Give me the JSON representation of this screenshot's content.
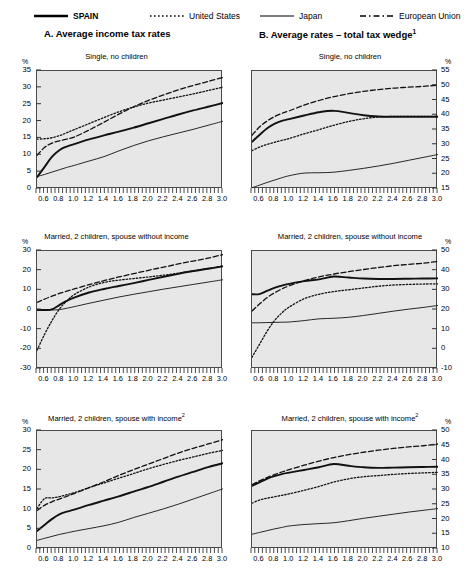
{
  "legend": {
    "items": [
      {
        "label": "SPAIN",
        "style": "bold-solid",
        "bold": true
      },
      {
        "label": "United States",
        "style": "dotted",
        "bold": false
      },
      {
        "label": "Japan",
        "style": "solid",
        "bold": false
      },
      {
        "label": "European Union",
        "style": "dashed",
        "bold": false
      }
    ]
  },
  "panels": [
    {
      "label": "A.  Average income tax rates",
      "footnote": ""
    },
    {
      "label": "B.  Average rates – total tax wedge",
      "footnote": "1"
    }
  ],
  "axis": {
    "percent_symbol": "%",
    "x_ticks": [
      "0.6",
      "0.8",
      "1.0",
      "1.2",
      "1.4",
      "1.6",
      "1.8",
      "2.0",
      "2.2",
      "2.4",
      "2.6",
      "2.8",
      "3.0"
    ]
  },
  "chart_data": [
    {
      "id": "A1",
      "type": "line",
      "title": "Single, no children",
      "panel": "A. Average income tax rates",
      "xlabel": "",
      "ylabel": "%",
      "xlim": [
        0.5,
        3.0
      ],
      "ylim": [
        0,
        35
      ],
      "yticks": [
        0,
        5,
        10,
        15,
        20,
        25,
        30,
        35
      ],
      "x": [
        0.5,
        0.6,
        0.7,
        0.8,
        0.9,
        1.0,
        1.2,
        1.4,
        1.6,
        1.8,
        2.0,
        2.2,
        2.4,
        2.6,
        2.8,
        3.0
      ],
      "series": [
        {
          "name": "SPAIN",
          "style": "bold-solid",
          "values": [
            3.5,
            6.5,
            9.5,
            11.5,
            12.6,
            13.3,
            14.7,
            15.9,
            17.0,
            18.2,
            19.5,
            20.8,
            22.1,
            23.3,
            24.4,
            25.5
          ]
        },
        {
          "name": "United States",
          "style": "dotted",
          "values": [
            14.8,
            14.9,
            15.2,
            15.8,
            16.7,
            17.6,
            19.4,
            21.2,
            22.9,
            24.3,
            25.5,
            26.4,
            27.3,
            28.2,
            29.2,
            30.2
          ]
        },
        {
          "name": "Japan",
          "style": "solid",
          "values": [
            3.7,
            4.3,
            5.0,
            5.7,
            6.4,
            7.0,
            8.3,
            9.6,
            11.3,
            12.9,
            14.3,
            15.5,
            16.6,
            17.7,
            18.9,
            20.1
          ]
        },
        {
          "name": "European Union",
          "style": "dashed",
          "values": [
            10.0,
            12.3,
            13.6,
            14.3,
            14.8,
            15.4,
            17.5,
            19.8,
            22.2,
            24.4,
            26.3,
            27.9,
            29.4,
            30.7,
            31.9,
            33.1
          ]
        }
      ]
    },
    {
      "id": "B1",
      "type": "line",
      "title": "Single, no children",
      "panel": "B. Average rates – total tax wedge",
      "xlabel": "",
      "ylabel": "%",
      "xlim": [
        0.5,
        3.0
      ],
      "ylim": [
        15,
        55
      ],
      "yticks": [
        15,
        20,
        25,
        30,
        35,
        40,
        45,
        50,
        55
      ],
      "x": [
        0.5,
        0.6,
        0.7,
        0.8,
        0.9,
        1.0,
        1.2,
        1.4,
        1.6,
        1.8,
        2.0,
        2.2,
        2.4,
        2.6,
        2.8,
        3.0
      ],
      "series": [
        {
          "name": "SPAIN",
          "style": "bold-solid",
          "values": [
            31.0,
            33.3,
            35.5,
            37.1,
            38.1,
            38.7,
            39.9,
            41.0,
            41.5,
            40.8,
            40.0,
            39.6,
            39.5,
            39.5,
            39.5,
            39.5
          ]
        },
        {
          "name": "United States",
          "style": "dotted",
          "values": [
            28.0,
            29.2,
            30.1,
            30.8,
            31.5,
            32.1,
            33.7,
            35.1,
            36.6,
            37.9,
            38.8,
            39.4,
            39.6,
            39.6,
            39.6,
            39.6
          ]
        },
        {
          "name": "Japan",
          "style": "solid",
          "values": [
            15.4,
            16.3,
            17.2,
            18.0,
            18.8,
            19.5,
            20.4,
            20.5,
            20.7,
            21.3,
            22.0,
            22.8,
            23.7,
            24.7,
            25.7,
            26.7
          ]
        },
        {
          "name": "European Union",
          "style": "dashed",
          "values": [
            33.2,
            36.0,
            38.0,
            39.5,
            40.6,
            41.5,
            43.4,
            45.0,
            46.3,
            47.3,
            48.1,
            48.7,
            49.2,
            49.5,
            49.8,
            50.2
          ]
        }
      ]
    },
    {
      "id": "A2",
      "type": "line",
      "title": "Married, 2 children, spouse without income",
      "panel": "A. Average income tax rates",
      "xlabel": "",
      "ylabel": "%",
      "xlim": [
        0.5,
        3.0
      ],
      "ylim": [
        -30,
        30
      ],
      "yticks": [
        -30,
        -20,
        -10,
        0,
        10,
        20,
        30
      ],
      "x": [
        0.5,
        0.6,
        0.7,
        0.8,
        0.9,
        1.0,
        1.2,
        1.4,
        1.6,
        1.8,
        2.0,
        2.2,
        2.4,
        2.6,
        2.8,
        3.0
      ],
      "series": [
        {
          "name": "SPAIN",
          "style": "bold-solid",
          "values": [
            0.0,
            0.0,
            0.3,
            2.5,
            4.6,
            6.3,
            8.9,
            10.7,
            12.2,
            13.7,
            15.3,
            16.9,
            18.4,
            19.8,
            21.0,
            22.2
          ]
        },
        {
          "name": "United States",
          "style": "dotted",
          "values": [
            -20.5,
            -12.5,
            -5.5,
            0.4,
            4.6,
            7.8,
            11.7,
            14.0,
            15.2,
            16.0,
            16.8,
            17.7,
            18.7,
            19.9,
            21.1,
            22.4
          ]
        },
        {
          "name": "Japan",
          "style": "solid",
          "values": [
            0.0,
            0.0,
            0.0,
            0.2,
            0.9,
            1.7,
            3.4,
            5.0,
            6.6,
            8.0,
            9.3,
            10.6,
            11.8,
            13.0,
            14.2,
            15.4
          ]
        },
        {
          "name": "European Union",
          "style": "dashed",
          "values": [
            3.8,
            5.5,
            7.0,
            8.4,
            9.6,
            10.7,
            12.9,
            14.9,
            16.8,
            18.5,
            20.2,
            21.8,
            23.4,
            24.9,
            26.4,
            28.2
          ]
        }
      ]
    },
    {
      "id": "B2",
      "type": "line",
      "title": "Married, 2 children, spouse without income",
      "panel": "B. Average rates – total tax wedge",
      "xlabel": "",
      "ylabel": "%",
      "xlim": [
        0.5,
        3.0
      ],
      "ylim": [
        -10,
        50
      ],
      "yticks": [
        -10,
        0,
        10,
        20,
        30,
        40,
        50
      ],
      "x": [
        0.5,
        0.6,
        0.7,
        0.8,
        0.9,
        1.0,
        1.2,
        1.4,
        1.6,
        1.8,
        2.0,
        2.2,
        2.4,
        2.6,
        2.8,
        3.0
      ],
      "series": [
        {
          "name": "SPAIN",
          "style": "bold-solid",
          "values": [
            28.0,
            28.1,
            29.7,
            31.2,
            32.4,
            33.3,
            34.7,
            35.6,
            37.0,
            36.5,
            36.0,
            35.8,
            35.8,
            35.9,
            36.0,
            36.1
          ]
        },
        {
          "name": "United States",
          "style": "dotted",
          "values": [
            -4.0,
            2.5,
            9.0,
            14.5,
            18.5,
            21.5,
            25.7,
            28.0,
            29.4,
            30.3,
            31.2,
            32.1,
            32.7,
            33.0,
            33.2,
            33.3
          ]
        },
        {
          "name": "Japan",
          "style": "solid",
          "values": [
            13.5,
            13.5,
            13.6,
            13.7,
            13.8,
            13.9,
            14.6,
            15.5,
            15.8,
            16.3,
            17.2,
            18.3,
            19.4,
            20.4,
            21.3,
            22.3
          ]
        },
        {
          "name": "European Union",
          "style": "dashed",
          "values": [
            19.5,
            23.0,
            26.2,
            28.7,
            30.7,
            32.3,
            34.9,
            36.8,
            38.3,
            39.5,
            40.6,
            41.6,
            42.5,
            43.2,
            43.8,
            44.7
          ]
        }
      ]
    },
    {
      "id": "A3",
      "type": "line",
      "title": "Married, 2 children, spouse with income",
      "footnote": "2",
      "panel": "A. Average income tax rates",
      "xlabel": "",
      "ylabel": "%",
      "xlim": [
        0.5,
        3.0
      ],
      "ylim": [
        0,
        30
      ],
      "yticks": [
        0,
        5,
        10,
        15,
        20,
        25,
        30
      ],
      "x": [
        0.5,
        0.6,
        0.7,
        0.8,
        0.9,
        1.0,
        1.2,
        1.4,
        1.6,
        1.8,
        2.0,
        2.2,
        2.4,
        2.6,
        2.8,
        3.0
      ],
      "series": [
        {
          "name": "SPAIN",
          "style": "bold-solid",
          "values": [
            4.6,
            6.1,
            7.6,
            8.8,
            9.5,
            10.0,
            11.2,
            12.3,
            13.4,
            14.6,
            15.8,
            17.1,
            18.4,
            19.6,
            20.8,
            21.8
          ]
        },
        {
          "name": "United States",
          "style": "dotted",
          "values": [
            10.3,
            12.8,
            13.0,
            13.3,
            13.8,
            14.3,
            15.6,
            16.8,
            18.0,
            19.2,
            20.4,
            21.5,
            22.5,
            23.4,
            24.3,
            25.1
          ]
        },
        {
          "name": "Japan",
          "style": "solid",
          "values": [
            2.2,
            2.7,
            3.2,
            3.7,
            4.1,
            4.5,
            5.2,
            5.9,
            6.8,
            8.0,
            9.1,
            10.2,
            11.4,
            12.7,
            14.0,
            15.3
          ]
        },
        {
          "name": "European Union",
          "style": "dashed",
          "values": [
            9.8,
            11.1,
            12.0,
            12.7,
            13.4,
            14.1,
            15.6,
            17.1,
            18.7,
            20.2,
            21.6,
            23.0,
            24.4,
            25.6,
            26.7,
            27.8
          ]
        }
      ]
    },
    {
      "id": "B3",
      "type": "line",
      "title": "Married, 2 children, spouse with income",
      "footnote": "2",
      "panel": "B. Average rates – total tax wedge",
      "xlabel": "",
      "ylabel": "%",
      "xlim": [
        0.5,
        3.0
      ],
      "ylim": [
        10,
        50
      ],
      "yticks": [
        10,
        15,
        20,
        25,
        30,
        35,
        40,
        45,
        50
      ],
      "x": [
        0.5,
        0.6,
        0.7,
        0.8,
        0.9,
        1.0,
        1.2,
        1.4,
        1.6,
        1.8,
        2.0,
        2.2,
        2.4,
        2.6,
        2.8,
        3.0
      ],
      "series": [
        {
          "name": "SPAIN",
          "style": "bold-solid",
          "values": [
            31.4,
            32.6,
            33.8,
            34.7,
            35.4,
            35.9,
            36.8,
            37.7,
            38.8,
            38.2,
            37.7,
            37.5,
            37.6,
            37.7,
            37.8,
            37.9
          ]
        },
        {
          "name": "United States",
          "style": "dotted",
          "values": [
            25.5,
            26.6,
            27.2,
            27.7,
            28.2,
            28.7,
            29.9,
            31.2,
            32.7,
            33.8,
            34.5,
            34.9,
            35.3,
            35.6,
            35.8,
            36.0
          ]
        },
        {
          "name": "Japan",
          "style": "solid",
          "values": [
            15.0,
            15.6,
            16.2,
            16.8,
            17.3,
            17.8,
            18.3,
            18.6,
            18.9,
            19.6,
            20.4,
            21.1,
            21.8,
            22.5,
            23.1,
            23.7
          ]
        },
        {
          "name": "European Union",
          "style": "dashed",
          "values": [
            31.8,
            33.1,
            34.2,
            35.2,
            36.1,
            36.9,
            38.4,
            39.8,
            41.0,
            42.0,
            42.8,
            43.5,
            44.1,
            44.6,
            45.0,
            45.6
          ]
        }
      ]
    }
  ]
}
